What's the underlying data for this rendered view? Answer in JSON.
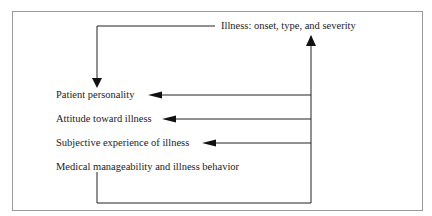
{
  "diagram": {
    "source_node": {
      "label": "Illness: onset, type, and severity"
    },
    "target_nodes": [
      {
        "label": "Patient personality"
      },
      {
        "label": "Attitude toward illness"
      },
      {
        "label": "Subjective experience of illness"
      },
      {
        "label": "Medical manageability and illness behavior"
      }
    ],
    "edges": [
      {
        "from": "Illness: onset, type, and severity",
        "to": "Patient personality"
      },
      {
        "from": "Illness: onset, type, and severity",
        "to": "Attitude toward illness"
      },
      {
        "from": "Illness: onset, type, and severity",
        "to": "Subjective experience of illness"
      },
      {
        "from": "Medical manageability and illness behavior",
        "to": "Illness: onset, type, and severity"
      }
    ]
  }
}
